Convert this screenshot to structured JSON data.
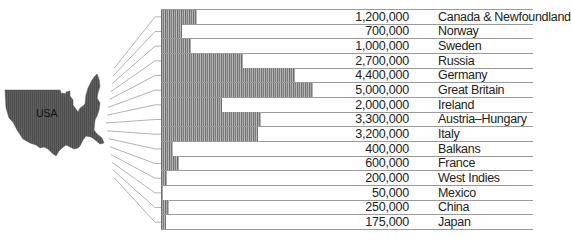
{
  "chart_data": {
    "type": "bar",
    "orientation": "horizontal",
    "title": "",
    "xlabel": "",
    "ylabel": "",
    "annotation": "USA",
    "legend": null,
    "grid": false,
    "xlim": [
      0,
      5000000
    ],
    "categories": [
      "Canada & Newfoundland",
      "Norway",
      "Sweden",
      "Russia",
      "Germany",
      "Great Britain",
      "Ireland",
      "Austria–Hungary",
      "Italy",
      "Balkans",
      "France",
      "West Indies",
      "Mexico",
      "China",
      "Japan"
    ],
    "values": [
      1200000,
      700000,
      1000000,
      2700000,
      4400000,
      5000000,
      2000000,
      3300000,
      3200000,
      400000,
      600000,
      200000,
      50000,
      250000,
      175000
    ],
    "value_labels": [
      "1,200,000",
      "700,000",
      "1,000,000",
      "2,700,000",
      "4,400,000",
      "5,000,000",
      "2,000,000",
      "3,300,000",
      "3,200,000",
      "400,000",
      "600,000",
      "200,000",
      "50,000",
      "250,000",
      "175,000"
    ]
  },
  "map": {
    "label": "USA",
    "fill": "#5a5a5a"
  },
  "colors": {
    "bar": "#8a8a8a",
    "rule": "#9a9a9a",
    "text": "#222222"
  }
}
